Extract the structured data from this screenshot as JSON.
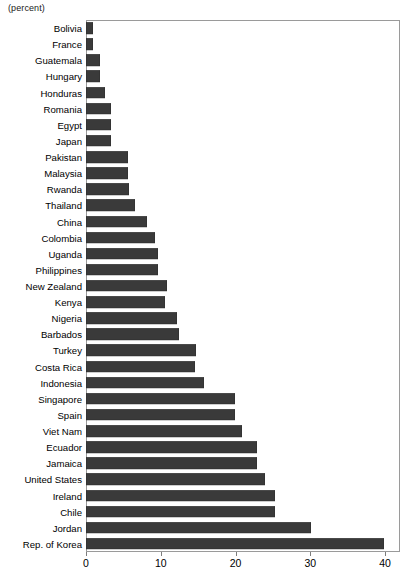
{
  "chart_data": {
    "type": "bar",
    "orientation": "horizontal",
    "title": "",
    "subtitle": "",
    "unit_label": "(percent)",
    "xlabel": "",
    "ylabel": "",
    "xlim": [
      0,
      42
    ],
    "axis_ticks": [
      0,
      10,
      20,
      30,
      40
    ],
    "tick_labels": [
      "0",
      "10",
      "20",
      "30",
      "40"
    ],
    "grid": false,
    "legend": "none",
    "bar_color": "#3a3a3a",
    "categories": [
      "Bolivia",
      "France",
      "Guatemala",
      "Hungary",
      "Honduras",
      "Romania",
      "Egypt",
      "Japan",
      "Pakistan",
      "Malaysia",
      "Rwanda",
      "Thailand",
      "China",
      "Colombia",
      "Uganda",
      "Philippines",
      "New Zealand",
      "Kenya",
      "Nigeria",
      "Barbados",
      "Turkey",
      "Costa Rica",
      "Indonesia",
      "Singapore",
      "Spain",
      "Viet Nam",
      "Ecuador",
      "Jamaica",
      "United States",
      "Ireland",
      "Chile",
      "Jordan",
      "Rep. of Korea"
    ],
    "values": [
      0.9,
      0.9,
      1.9,
      1.9,
      2.6,
      3.3,
      3.4,
      3.4,
      5.6,
      5.6,
      5.7,
      6.6,
      8.2,
      9.2,
      9.6,
      9.6,
      10.8,
      10.6,
      12.2,
      12.5,
      14.7,
      14.6,
      15.8,
      19.9,
      19.9,
      20.9,
      22.9,
      22.9,
      24.0,
      25.3,
      25.3,
      30.1,
      39.9
    ]
  }
}
